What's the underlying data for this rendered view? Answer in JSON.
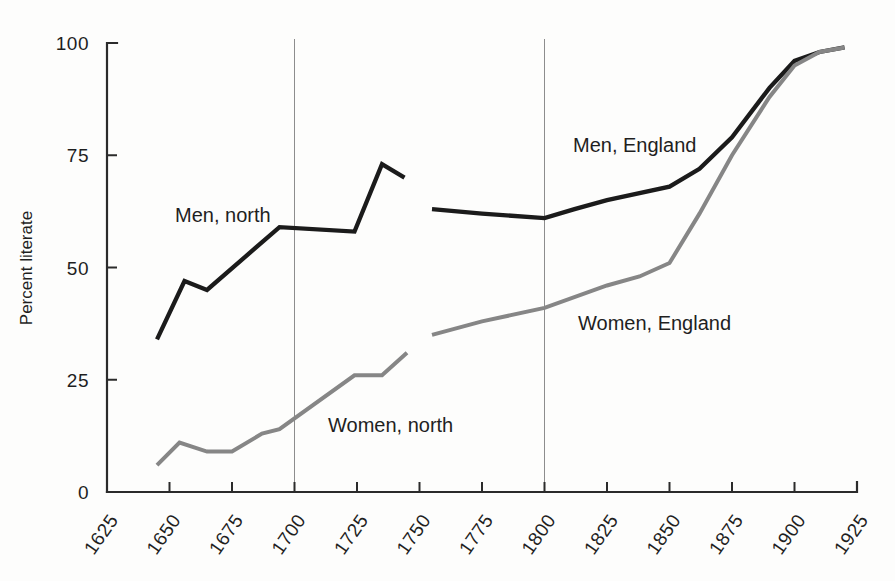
{
  "chart_data": {
    "type": "line",
    "title": "",
    "subtitle": "",
    "xlabel": "",
    "ylabel": "Percent literate",
    "xlim": [
      1625,
      1925
    ],
    "ylim": [
      0,
      100
    ],
    "grid": "vertical gridlines at 1700 and 1800 only",
    "legend_position": "inline labels next to each series",
    "x_ticks": [
      1625,
      1650,
      1675,
      1700,
      1725,
      1750,
      1775,
      1800,
      1825,
      1850,
      1875,
      1900,
      1925
    ],
    "x_tick_labels": [
      "1625",
      "1650",
      "1675",
      "1700",
      "1725",
      "1750",
      "1775",
      "1800",
      "1825",
      "1850",
      "1875",
      "1900",
      "1925"
    ],
    "y_ticks": [
      0,
      25,
      50,
      75,
      100
    ],
    "y_tick_labels": [
      "0",
      "25",
      "50",
      "75",
      "100"
    ],
    "gridline_years": [
      1700,
      1800
    ],
    "series": [
      {
        "name": "Men, north",
        "label": "Men, north",
        "color": "#1b1b1b",
        "x": [
          1645,
          1656,
          1665,
          1694,
          1724,
          1735,
          1744
        ],
        "values": [
          34,
          47,
          45,
          59,
          58,
          73,
          70
        ]
      },
      {
        "name": "Women, north",
        "label": "Women, north",
        "color": "#868686",
        "x": [
          1645,
          1654,
          1665,
          1675,
          1687,
          1694,
          1724,
          1735,
          1745
        ],
        "values": [
          6,
          11,
          9,
          9,
          13,
          14,
          26,
          26,
          31
        ]
      },
      {
        "name": "Men, England",
        "label": "Men, England",
        "color": "#1b1b1b",
        "x": [
          1755,
          1775,
          1800,
          1812,
          1825,
          1850,
          1862,
          1875,
          1890,
          1900,
          1910,
          1920
        ],
        "values": [
          63,
          62,
          61,
          63,
          65,
          68,
          72,
          79,
          90,
          96,
          98,
          99
        ]
      },
      {
        "name": "Women, England",
        "label": "Women, England",
        "color": "#868686",
        "x": [
          1755,
          1775,
          1800,
          1825,
          1838,
          1850,
          1862,
          1875,
          1890,
          1900,
          1910,
          1920
        ],
        "values": [
          35,
          38,
          41,
          46,
          48,
          51,
          62,
          75,
          88,
          95,
          98,
          99
        ]
      }
    ]
  },
  "axis": {
    "y_title": "Percent literate"
  },
  "annotations": [
    {
      "name": "men-north",
      "text": "Men, north",
      "x": 175,
      "y": 222
    },
    {
      "name": "women-north",
      "text": "Women, north",
      "x": 328,
      "y": 432
    },
    {
      "name": "men-england",
      "text": "Men, England",
      "x": 573,
      "y": 152
    },
    {
      "name": "women-england",
      "text": "Women, England",
      "x": 578,
      "y": 330
    }
  ],
  "colors": {
    "men_line": "#1b1b1b",
    "women_line": "#868686",
    "axis": "#2b2b2b",
    "gridline": "#8d8d8d",
    "background": "#fdfdfc"
  }
}
